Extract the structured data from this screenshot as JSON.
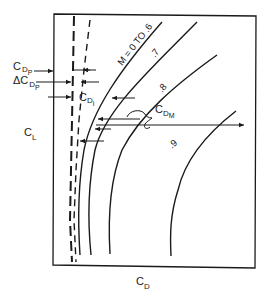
{
  "diagram": {
    "axes": {
      "x_label": "C",
      "x_label_sub": "D",
      "y_label": "C",
      "y_label_sub": "L"
    },
    "curves": [
      {
        "label": "M = 0 TO .6"
      },
      {
        "label": ".7"
      },
      {
        "label": ".8"
      },
      {
        "label": ".9"
      }
    ],
    "annotations": {
      "cdp": {
        "main": "C",
        "sub1": "D",
        "sub2": "P"
      },
      "delta_cdp": {
        "main": "ΔC",
        "sub1": "D",
        "sub2": "P"
      },
      "cdi": {
        "main": "C",
        "sub1": "D",
        "sub2": "i"
      },
      "cdm": {
        "main": "C",
        "sub1": "D",
        "sub2": "M"
      }
    },
    "colors": {
      "ink": "#1a1a1a",
      "background": "#ffffff"
    }
  }
}
